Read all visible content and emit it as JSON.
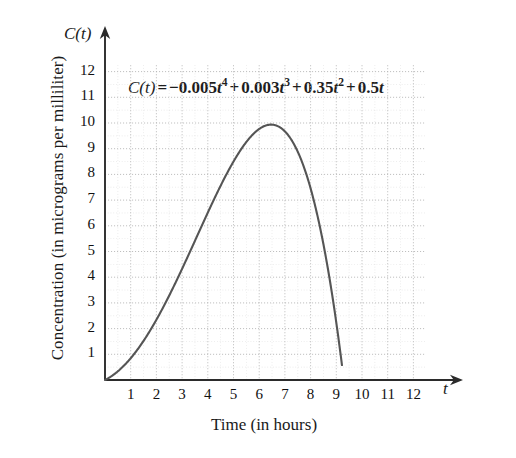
{
  "chart_data": {
    "type": "line",
    "title": "",
    "equation_text": "C(t) = −0.005t⁴ + 0.003t³ + 0.35t² + 0.5t",
    "equation_parts": {
      "lhs": "C(t)",
      "equals": "=",
      "term1_coef": "−0.005",
      "term1_var": "t",
      "term1_exp": "4",
      "plus1": "+",
      "term2_coef": "0.003",
      "term2_var": "t",
      "term2_exp": "3",
      "plus2": "+",
      "term3_coef": "0.35",
      "term3_var": "t",
      "term3_exp": "2",
      "plus3": "+",
      "term4_coef": "0.5",
      "term4_var": "t"
    },
    "xlabel": "Time (in hours)",
    "ylabel": "Concentration (in micrograms per milliliter)",
    "x_axis_variable": "t",
    "y_axis_variable": "C(t)",
    "xlim": [
      0,
      12.5
    ],
    "ylim": [
      0,
      12.6
    ],
    "xticks": [
      1,
      2,
      3,
      4,
      5,
      6,
      7,
      8,
      9,
      10,
      11,
      12
    ],
    "yticks": [
      1,
      2,
      3,
      4,
      5,
      6,
      7,
      8,
      9,
      10,
      11,
      12
    ],
    "xtick_labels": [
      "1",
      "2",
      "3",
      "4",
      "5",
      "6",
      "7",
      "8",
      "9",
      "10",
      "11",
      "12"
    ],
    "ytick_labels": [
      "1",
      "2",
      "3",
      "4",
      "5",
      "6",
      "7",
      "8",
      "9",
      "10",
      "11",
      "12"
    ],
    "grid": true,
    "grid_style": "dotted",
    "grid_color": "#c8c8c8",
    "legend": "none",
    "curve_color": "#555555",
    "axis_color": "#2b2b2b",
    "annotations": [
      {
        "text": "C(t) = −0.005t⁴ + 0.003t³ + 0.35t² + 0.5t",
        "x": 1.0,
        "y": 11.0
      }
    ],
    "series": [
      {
        "name": "C(t)",
        "coefficients": {
          "t4": -0.005,
          "t3": 0.003,
          "t2": 0.35,
          "t1": 0.5,
          "t0": 0
        },
        "domain": [
          0,
          9.22
        ],
        "peak": {
          "x": 6.5,
          "y": 10.0
        },
        "zero_crossings": [
          0,
          9.22
        ],
        "x": [
          0,
          0.5,
          1,
          1.5,
          2,
          2.5,
          3,
          3.5,
          4,
          4.5,
          5,
          5.5,
          6,
          6.5,
          7,
          7.5,
          8,
          8.5,
          9,
          9.22
        ],
        "y": [
          0,
          0.34,
          0.85,
          1.55,
          2.43,
          3.47,
          4.63,
          5.87,
          7.12,
          8.3,
          9.33,
          10.1,
          10.5,
          10.46,
          9.86,
          8.59,
          6.53,
          3.59,
          -0.38,
          -2.7
        ]
      }
    ]
  }
}
